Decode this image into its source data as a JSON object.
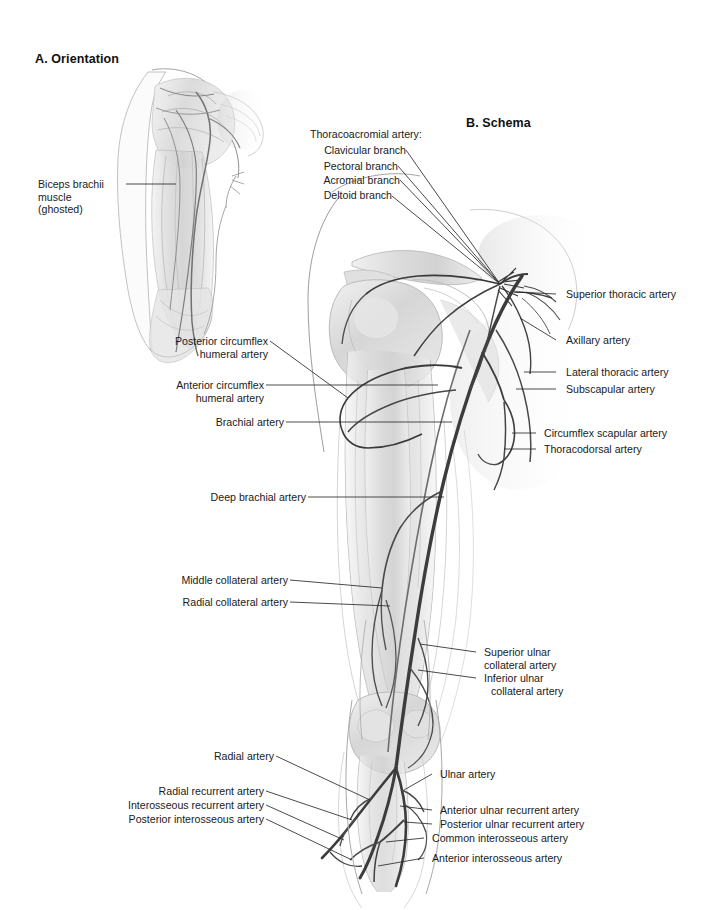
{
  "plate": {
    "background_color": "#ffffff",
    "text_color": "#1a1a1a",
    "vessel_color": "#3a3a3a",
    "leader_color": "#2b2b2b",
    "ghost_light": "#e8e8e8",
    "ghost_mid": "#c9c9c9",
    "ghost_dark": "#9a9a9a"
  },
  "panels": {
    "orientation": {
      "title": "A. Orientation",
      "label": {
        "line1": "Biceps brachii",
        "line2": "muscle",
        "line3": "(ghosted)"
      }
    },
    "schema": {
      "title": "B. Schema"
    }
  },
  "labels": {
    "thoracoacromial_header": "Thoracoacromial artery:",
    "clavicular_branch": "Clavicular branch",
    "pectoral_branch": "Pectoral branch",
    "acromial_branch": "Acromial branch",
    "deltoid_branch": "Deltoid branch",
    "superior_thoracic": "Superior thoracic artery",
    "axillary": "Axillary artery",
    "lateral_thoracic": "Lateral thoracic artery",
    "subscapular": "Subscapular artery",
    "circumflex_scapular": "Circumflex scapular artery",
    "thoracodorsal": "Thoracodorsal artery",
    "posterior_circumflex_humeral_1": "Posterior circumflex",
    "posterior_circumflex_humeral_2": "humeral artery",
    "anterior_circumflex_humeral_1": "Anterior circumflex",
    "anterior_circumflex_humeral_2": "humeral artery",
    "brachial": "Brachial artery",
    "deep_brachial": "Deep brachial artery",
    "middle_collateral": "Middle collateral artery",
    "radial_collateral": "Radial collateral artery",
    "superior_ulnar_collateral_1": "Superior ulnar",
    "superior_ulnar_collateral_2": "collateral artery",
    "inferior_ulnar_collateral_1": "Inferior ulnar",
    "inferior_ulnar_collateral_2": "collateral artery",
    "radial": "Radial artery",
    "ulnar": "Ulnar artery",
    "radial_recurrent": "Radial recurrent artery",
    "interosseous_recurrent": "Interosseous recurrent artery",
    "posterior_interosseous": "Posterior interosseous artery",
    "anterior_ulnar_recurrent": "Anterior ulnar recurrent artery",
    "posterior_ulnar_recurrent": "Posterior ulnar recurrent artery",
    "common_interosseous": "Common interosseous artery",
    "anterior_interosseous": "Anterior interosseous artery"
  }
}
